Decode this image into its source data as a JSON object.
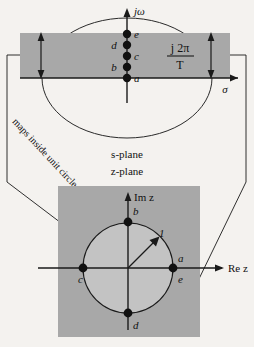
{
  "figure": {
    "title_s_plane": "s-plane",
    "title_z_plane": "z-plane",
    "axes": {
      "s_vertical": "jω",
      "s_horizontal": "σ",
      "z_vertical": "Im z",
      "z_horizontal": "Re z"
    },
    "strip_annotation": {
      "numerator": "j 2π",
      "denominator": "T"
    },
    "callouts": {
      "left": "maps inside unit circle",
      "right": "maps outside unit circle"
    },
    "unit_radius_label": "1",
    "s_plane_points": [
      {
        "label": "a",
        "x": 127,
        "y": 78,
        "label_dx": 7,
        "label_dy": 4
      },
      {
        "label": "b",
        "x": 127,
        "y": 67,
        "label_dx": -13,
        "label_dy": 4
      },
      {
        "label": "c",
        "x": 127,
        "y": 56,
        "label_dx": 7,
        "label_dy": 4
      },
      {
        "label": "d",
        "x": 127,
        "y": 45,
        "label_dx": -13,
        "label_dy": 4
      },
      {
        "label": "e",
        "x": 127,
        "y": 34,
        "label_dx": 7,
        "label_dy": 4
      }
    ],
    "z_plane_points": [
      {
        "label": "a",
        "x": 173,
        "y": 268,
        "label_dx": 4,
        "label_dy": -7
      },
      {
        "label": "b",
        "x": 128,
        "y": 222,
        "label_dx": 4,
        "label_dy": -8
      },
      {
        "label": "c",
        "x": 83,
        "y": 268,
        "label_dx": -5,
        "label_dy": 14
      },
      {
        "label": "d",
        "x": 128,
        "y": 313,
        "label_dx": 4,
        "label_dy": 14
      },
      {
        "label": "e",
        "x": 173,
        "y": 268,
        "label_dx": 4,
        "label_dy": 15
      }
    ],
    "colors": {
      "strip_fill": "#a8a8a8",
      "zbox_fill": "#a8a8a8",
      "circle_fill": "#c3c3c3",
      "stroke": "#1a1a1a",
      "page_bg": "#f4f2ef"
    },
    "geometry": {
      "s_strip": {
        "x": 20,
        "y": 33,
        "w": 210,
        "h": 45
      },
      "z_box": {
        "x": 58,
        "y": 186,
        "w": 142,
        "h": 151
      },
      "s_ellipse": {
        "cx": 127,
        "cy": 78,
        "rx": 85,
        "ry": 60
      },
      "z_circle": {
        "cx": 128,
        "cy": 268,
        "r": 45
      }
    }
  }
}
